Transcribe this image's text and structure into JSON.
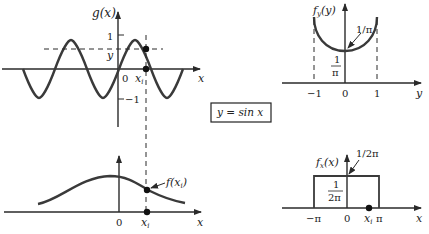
{
  "colors": {
    "ink": "#2a2a2a",
    "curve": "#3a3a3a",
    "background": "#ffffff"
  },
  "transform_box": {
    "label": "y = sin x"
  },
  "panels": {
    "g_of_x": {
      "y_axis_label": "g(x)",
      "x_axis_label": "x",
      "tick_one": "1",
      "tick_minus_one": "−1",
      "origin": "0",
      "y_marker": "y",
      "xi_label": "x",
      "xi_sub": "i"
    },
    "f_of_x": {
      "x_axis_label": "x",
      "origin": "0",
      "xi_label": "x",
      "xi_sub": "i",
      "point_label": "f(x",
      "point_sub": "i",
      "point_close": ")"
    },
    "fy_of_y": {
      "y_axis_label": "f",
      "y_axis_sub": "y",
      "y_axis_arg": "(y)",
      "x_axis_label": "y",
      "tick_minus_one": "−1",
      "origin": "0",
      "tick_one": "1",
      "min_annotation": "1/π",
      "frac_num": "1",
      "frac_den": "π"
    },
    "fx_of_x": {
      "y_axis_label": "f",
      "y_axis_sub": "x",
      "y_axis_arg": "(x)",
      "x_axis_label": "x",
      "tick_minus_pi": "−π",
      "origin": "0",
      "xi_label": "x",
      "xi_sub": "i",
      "tick_pi": "π",
      "top_annotation": "1/2π",
      "frac_num": "1",
      "frac_den": "2π"
    }
  }
}
